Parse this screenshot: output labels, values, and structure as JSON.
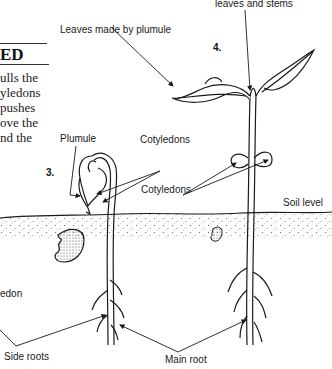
{
  "diagram": {
    "type": "bean seed germination (later stages)",
    "stages": [
      {
        "number": "3.",
        "description": "Hypocotyl pulls cotyledons out of soil"
      },
      {
        "number": "4.",
        "description": "Seedling with leaves and stems"
      }
    ]
  },
  "text_column": {
    "heading_fragment": "ED",
    "lines": [
      "ulls the",
      "yledons",
      " pushes",
      "ove the",
      "nd  the"
    ]
  },
  "labels": {
    "top_cut": "leaves and stems",
    "leaves_plumule": "Leaves made by plumule",
    "plumule": "Plumule",
    "cotyledons_upper": "Cotyledons",
    "cotyledons_lower": "Cotyledons",
    "soil_level": "Soil level",
    "cotyledon_cut": "edon",
    "side_roots": "Side roots",
    "main_root": "Main root",
    "stage3": "3.",
    "stage4": "4."
  },
  "colors": {
    "ink": "#1a1a1a",
    "background": "#ffffff",
    "soil_dots": "#555555"
  }
}
